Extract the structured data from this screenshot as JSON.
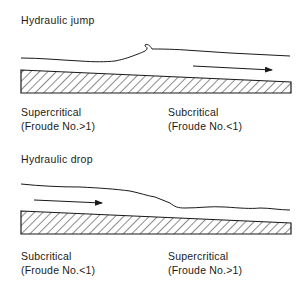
{
  "figure": {
    "panels": [
      {
        "title": "Hydraulic jump",
        "left_label": {
          "line1": "Supercritical",
          "line2": "(Froude No.>1)"
        },
        "right_label": {
          "line1": "Subcritical",
          "line2": "(Froude No.<1)"
        },
        "flow_arrow": "right-arrow",
        "feature": "water surface rises abruptly with breaking roller"
      },
      {
        "title": "Hydraulic drop",
        "left_label": {
          "line1": "Subcritical",
          "line2": "(Froude No.<1)"
        },
        "right_label": {
          "line1": "Supercritical",
          "line2": "(Froude No.>1)"
        },
        "flow_arrow": "right-arrow",
        "feature": "water surface falls gradually toward bed"
      }
    ],
    "colors": {
      "ink": "#1a1a1a",
      "background": "#ffffff"
    }
  }
}
